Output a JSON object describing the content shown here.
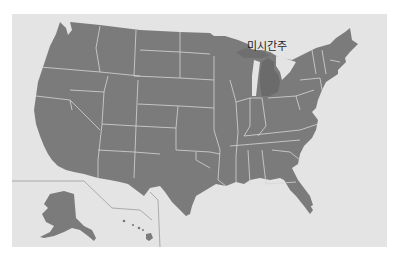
{
  "map": {
    "title": "United States map",
    "highlighted_state": {
      "name": "미시간주",
      "english": "Michigan"
    },
    "insets": [
      "Alaska",
      "Hawaii"
    ],
    "colors": {
      "page_background": "#ffffff",
      "panel_background": "#e4e4e4",
      "state_fill": "#7b7b7b",
      "highlight_fill": "#6b6b6b",
      "border": "#dadada",
      "inset_divider": "#9a9a9a",
      "label_text": "#1e1e1e"
    }
  }
}
